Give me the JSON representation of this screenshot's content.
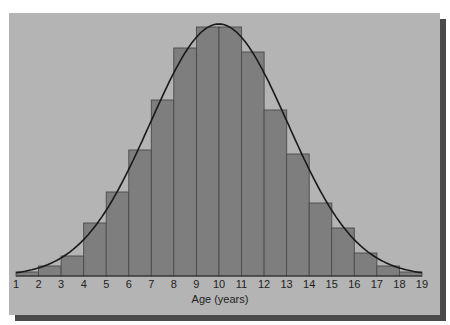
{
  "chart_data": {
    "type": "bar",
    "title": "",
    "xlabel": "Age (years)",
    "ylabel": "",
    "x_ticks": [
      "1",
      "2",
      "3",
      "4",
      "5",
      "6",
      "7",
      "8",
      "9",
      "10",
      "11",
      "12",
      "13",
      "14",
      "15",
      "16",
      "17",
      "18",
      "19"
    ],
    "categories": [
      "1-2",
      "2-3",
      "3-4",
      "4-5",
      "5-6",
      "6-7",
      "7-8",
      "8-9",
      "9-10",
      "10-11",
      "11-12",
      "12-13",
      "13-14",
      "14-15",
      "15-16",
      "16-17",
      "17-18",
      "18-19"
    ],
    "values": [
      4,
      10,
      20,
      53,
      84,
      126,
      176,
      228,
      249,
      249,
      224,
      166,
      122,
      73,
      48,
      23,
      10,
      4
    ],
    "value_units": "relative frequency (px height, unlabeled axis)",
    "overlay": {
      "type": "normal-curve",
      "mean": 10,
      "label": ""
    },
    "grid": false,
    "legend": null,
    "colors": {
      "background": "#b4b4b4",
      "bar_fill": "#7e7e7e",
      "bar_edge": "#4a4a4a",
      "curve": "#1a1a1a",
      "shadow": "#4a4a4a"
    }
  },
  "axis": {
    "title": "Age (years)"
  }
}
